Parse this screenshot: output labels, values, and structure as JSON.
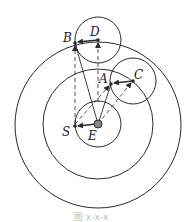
{
  "diagram": {
    "labels": {
      "B": "B",
      "D": "D",
      "A": "A",
      "C": "C",
      "S": "S",
      "E": "E"
    },
    "caption": "图 x-x-x",
    "colors": {
      "stroke": "#2a2a2a",
      "earth_fill": "#8a8a8a",
      "background": "#ffffff"
    }
  }
}
